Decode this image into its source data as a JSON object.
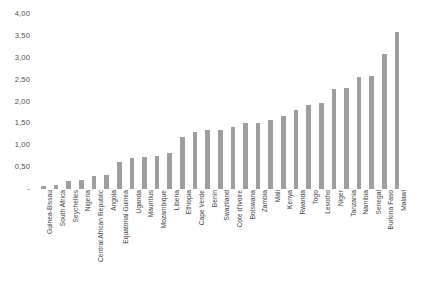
{
  "chart_data": {
    "type": "bar",
    "title": "",
    "subtitle": "",
    "xlabel": "",
    "ylabel": "",
    "ylim": [
      0,
      4.0
    ],
    "y_tick_step": 0.5,
    "grid": false,
    "legend": false,
    "decimal_separator": ",",
    "bar_color": "#9e9e9e",
    "zero_tick_label": "-",
    "yticklabels": [
      "4,00",
      "3,50",
      "3,00",
      "2,50",
      "2,00",
      "1,50",
      "1,00",
      "0,50",
      "-"
    ],
    "ytickvalues": [
      4.0,
      3.5,
      3.0,
      2.5,
      2.0,
      1.5,
      1.0,
      0.5,
      0.0
    ],
    "categories": [
      "Guinea-Bissau",
      "South Africa",
      "Seychelles",
      "Nigeria",
      "Central African Republic",
      "Angola",
      "Equatorial Guinea",
      "Uganda",
      "Mauritius",
      "Mozambique",
      "Liberia",
      "Ethiopia",
      "Cape Verde",
      "Benin",
      "Swaziland",
      "Cote d'Ivoire",
      "Botswana",
      "Zambia",
      "Mali",
      "Kenya",
      "Rwanda",
      "Togo",
      "Lesotho",
      "Niger",
      "Tanzania",
      "Namibia",
      "Senegal",
      "Burkina Faso",
      "Malawi"
    ],
    "values": [
      0.07,
      0.1,
      0.18,
      0.21,
      0.3,
      0.33,
      0.62,
      0.72,
      0.74,
      0.76,
      0.82,
      1.18,
      1.3,
      1.34,
      1.35,
      1.42,
      1.5,
      1.52,
      1.58,
      1.66,
      1.8,
      1.92,
      1.96,
      2.28,
      2.3,
      2.55,
      2.58,
      3.08,
      3.58
    ]
  }
}
